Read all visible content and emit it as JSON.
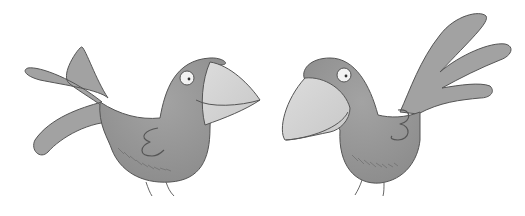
{
  "scene": {
    "description": "Two grey cartoon birds facing each other on a white background",
    "background": "#ffffff",
    "colors": {
      "body": "#9a9a9a",
      "body_shadow": "#7e7e7e",
      "beak": "#d6d6d6",
      "outline": "#555555",
      "eye_white": "#f2f2f2",
      "pupil": "#333333"
    }
  },
  "birds": [
    {
      "name": "left-bird",
      "facing": "right"
    },
    {
      "name": "right-bird",
      "facing": "left"
    }
  ]
}
